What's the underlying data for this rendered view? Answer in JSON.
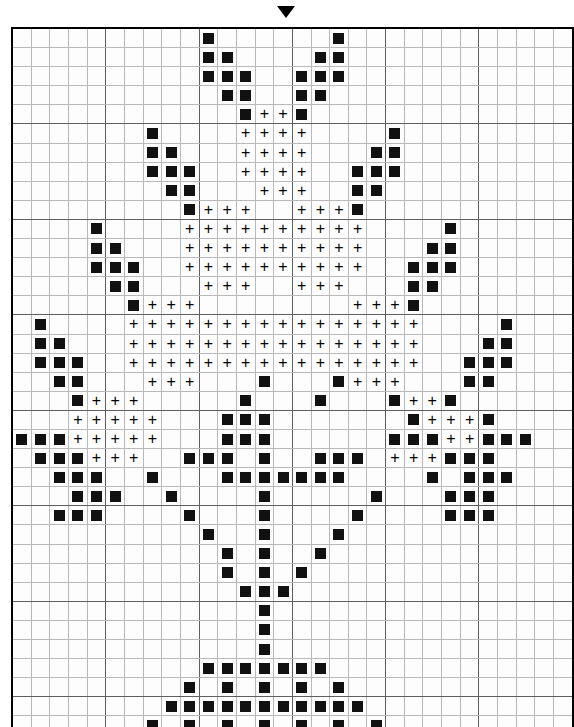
{
  "chart": {
    "type": "cross-stitch-grid",
    "columns": 30,
    "rows": 38,
    "cell_size_px": 18.4,
    "major_grid_every": 5,
    "grid_color": "#b9b9b9",
    "major_grid_color": "#5f5f5f",
    "border_color": "#000000",
    "background_color": "#ffffff",
    "center_marker": {
      "name": "center-column-marker",
      "shape": "down-triangle",
      "color": "#000000",
      "column": 15,
      "position": "top"
    },
    "symbols": [
      {
        "key": "sq",
        "glyph": "filled-square",
        "color": "#111111"
      },
      {
        "key": "pl",
        "glyph": "+",
        "color": "#000000"
      }
    ],
    "legend_visible": false,
    "stitches": [
      {
        "row": 1,
        "sq": [
          11,
          18
        ],
        "pl": []
      },
      {
        "row": 2,
        "sq": [
          11,
          12,
          17,
          18
        ],
        "pl": []
      },
      {
        "row": 3,
        "sq": [
          11,
          12,
          13,
          16,
          17,
          18
        ],
        "pl": []
      },
      {
        "row": 4,
        "sq": [
          12,
          13,
          16,
          17
        ],
        "pl": []
      },
      {
        "row": 5,
        "sq": [
          13,
          16
        ],
        "pl": [
          14,
          15
        ]
      },
      {
        "row": 6,
        "sq": [
          8,
          21
        ],
        "pl": [
          13,
          14,
          15,
          16
        ]
      },
      {
        "row": 7,
        "sq": [
          8,
          9,
          20,
          21
        ],
        "pl": [
          13,
          14,
          15,
          16
        ]
      },
      {
        "row": 8,
        "sq": [
          8,
          9,
          10,
          19,
          20,
          21
        ],
        "pl": [
          13,
          14,
          15,
          16
        ]
      },
      {
        "row": 9,
        "sq": [
          9,
          10,
          19,
          20
        ],
        "pl": [
          14,
          15,
          16
        ]
      },
      {
        "row": 10,
        "sq": [
          10,
          19
        ],
        "pl": [
          11,
          12,
          13,
          16,
          17,
          18
        ]
      },
      {
        "row": 11,
        "sq": [
          5,
          24
        ],
        "pl": [
          10,
          11,
          12,
          13,
          14,
          15,
          16,
          17,
          18,
          19
        ]
      },
      {
        "row": 12,
        "sq": [
          5,
          6,
          23,
          24
        ],
        "pl": [
          10,
          11,
          12,
          13,
          14,
          15,
          16,
          17,
          18,
          19
        ]
      },
      {
        "row": 13,
        "sq": [
          5,
          6,
          7,
          22,
          23,
          24
        ],
        "pl": [
          10,
          11,
          12,
          13,
          14,
          15,
          16,
          17,
          18,
          19
        ]
      },
      {
        "row": 14,
        "sq": [
          6,
          7,
          22,
          23
        ],
        "pl": [
          11,
          12,
          13,
          16,
          17,
          18
        ]
      },
      {
        "row": 15,
        "sq": [
          7,
          22
        ],
        "pl": [
          8,
          9,
          10,
          19,
          20,
          21
        ]
      },
      {
        "row": 16,
        "sq": [
          2,
          27
        ],
        "pl": [
          7,
          8,
          9,
          10,
          11,
          12,
          13,
          14,
          15,
          16,
          17,
          18,
          19,
          20,
          21,
          22
        ]
      },
      {
        "row": 17,
        "sq": [
          2,
          3,
          26,
          27
        ],
        "pl": [
          7,
          8,
          9,
          10,
          11,
          12,
          13,
          14,
          15,
          16,
          17,
          18,
          19,
          20,
          21,
          22
        ]
      },
      {
        "row": 18,
        "sq": [
          2,
          3,
          4,
          25,
          26,
          27
        ],
        "pl": [
          7,
          8,
          9,
          10,
          11,
          12,
          13,
          14,
          15,
          16,
          17,
          18,
          19,
          20,
          21,
          22
        ]
      },
      {
        "row": 19,
        "sq": [
          3,
          4,
          14,
          18,
          25,
          26
        ],
        "pl": [
          8,
          9,
          10,
          19,
          20,
          21
        ]
      },
      {
        "row": 20,
        "sq": [
          4,
          13,
          17,
          21,
          24
        ],
        "pl": [
          5,
          6,
          7,
          22,
          23
        ]
      },
      {
        "row": 21,
        "sq": [
          12,
          13,
          14,
          22,
          26
        ],
        "pl": [
          4,
          5,
          6,
          7,
          8,
          23,
          24,
          25
        ]
      },
      {
        "row": 22,
        "sq": [
          1,
          2,
          3,
          12,
          13,
          14,
          21,
          22,
          23,
          26,
          27,
          28
        ],
        "pl": [
          4,
          5,
          6,
          7,
          8,
          23,
          24,
          25
        ]
      },
      {
        "row": 23,
        "sq": [
          2,
          3,
          4,
          10,
          11,
          12,
          14,
          17,
          18,
          19,
          24,
          25,
          26
        ],
        "pl": [
          5,
          6,
          7,
          21,
          22,
          23
        ]
      },
      {
        "row": 24,
        "sq": [
          3,
          4,
          5,
          8,
          12,
          13,
          14,
          15,
          16,
          17,
          18,
          23,
          25,
          26,
          27
        ],
        "pl": []
      },
      {
        "row": 25,
        "sq": [
          4,
          5,
          6,
          9,
          14,
          20,
          24,
          25,
          26
        ],
        "pl": []
      },
      {
        "row": 26,
        "sq": [
          3,
          4,
          5,
          10,
          14,
          19,
          24,
          25,
          26
        ],
        "pl": []
      },
      {
        "row": 27,
        "sq": [
          11,
          14,
          18
        ],
        "pl": []
      },
      {
        "row": 28,
        "sq": [
          12,
          14,
          17
        ],
        "pl": []
      },
      {
        "row": 29,
        "sq": [
          12,
          14,
          16
        ],
        "pl": []
      },
      {
        "row": 30,
        "sq": [
          13,
          14,
          15
        ],
        "pl": []
      },
      {
        "row": 31,
        "sq": [
          14
        ],
        "pl": []
      },
      {
        "row": 32,
        "sq": [
          14
        ],
        "pl": []
      },
      {
        "row": 33,
        "sq": [
          14
        ],
        "pl": []
      },
      {
        "row": 34,
        "sq": [
          11,
          12,
          13,
          14,
          15,
          16,
          17
        ],
        "pl": []
      },
      {
        "row": 35,
        "sq": [
          10,
          12,
          14,
          16,
          18
        ],
        "pl": []
      },
      {
        "row": 36,
        "sq": [
          9,
          10,
          11,
          12,
          13,
          14,
          15,
          16,
          17,
          18,
          19
        ],
        "pl": []
      },
      {
        "row": 37,
        "sq": [
          8,
          10,
          12,
          14,
          16,
          18,
          20
        ],
        "pl": []
      },
      {
        "row": 38,
        "sq": [
          7,
          8,
          9,
          10,
          11,
          12,
          13,
          14,
          15,
          16,
          17,
          18,
          19,
          20,
          21
        ],
        "pl": []
      }
    ]
  }
}
